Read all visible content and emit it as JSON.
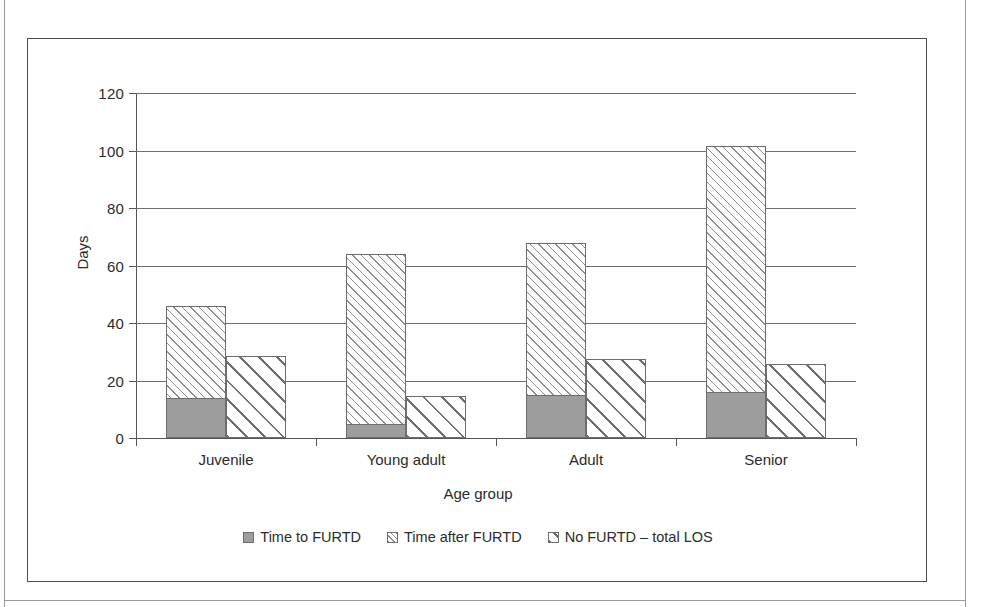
{
  "figure": {
    "frame_border_color": "#4a4a4a",
    "background": "#ffffff"
  },
  "chart_data": {
    "type": "bar",
    "subtype": "grouped-stacked",
    "title": "",
    "xlabel": "Age group",
    "ylabel": "Days",
    "ylim": [
      0,
      120
    ],
    "yticks": [
      0,
      20,
      40,
      60,
      80,
      100,
      120
    ],
    "ytick_labels": [
      "0",
      "20",
      "40",
      "60",
      "80",
      "100",
      "120"
    ],
    "grid": true,
    "grid_axis": "y",
    "legend_position": "bottom",
    "categories": [
      "Juvenile",
      "Young adult",
      "Adult",
      "Senior"
    ],
    "series": [
      {
        "name": "Time to FURTD",
        "fill": "solid-gray",
        "color": "#9d9d9d",
        "stack": "furtd",
        "values": [
          14.0,
          5.0,
          15.0,
          16.0
        ]
      },
      {
        "name": "Time after FURTD",
        "fill": "fine-diagonal-hatch",
        "color": "#8e8e8e",
        "stack": "furtd",
        "values": [
          32.0,
          59.0,
          53.0,
          85.5
        ]
      },
      {
        "name": "No FURTD – total LOS",
        "fill": "coarse-diagonal-hatch",
        "color": "#6f6f6f",
        "stack": "nofurtd",
        "values": [
          28.5,
          14.5,
          27.5,
          25.7
        ]
      }
    ],
    "stack_totals": [
      46.0,
      64.0,
      68.0,
      101.5
    ]
  },
  "legend": {
    "items": [
      {
        "label": "Time to FURTD",
        "swatch": "solid-gray-swatch"
      },
      {
        "label": "Time after FURTD",
        "swatch": "fine-hatch-swatch"
      },
      {
        "label": "No FURTD – total LOS",
        "swatch": "coarse-hatch-swatch"
      }
    ]
  }
}
